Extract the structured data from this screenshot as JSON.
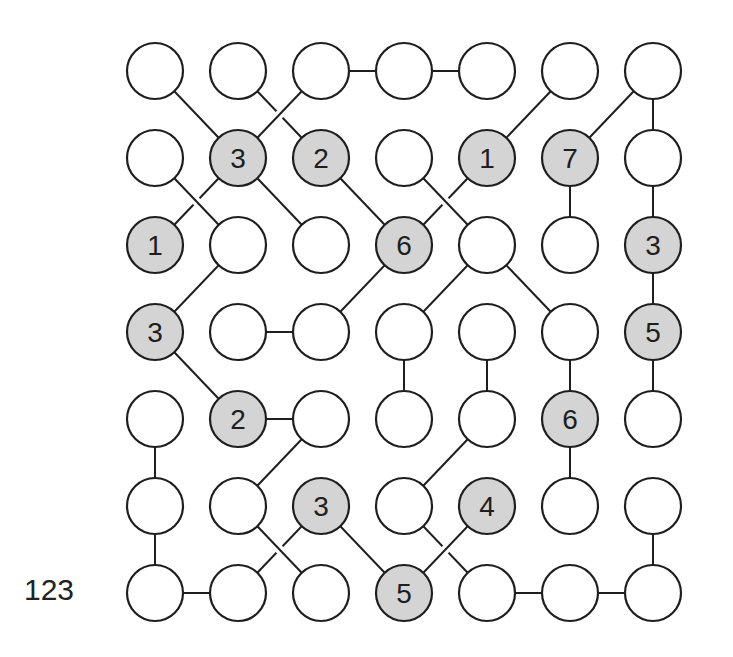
{
  "puzzle": {
    "id_label": "123",
    "rows": 7,
    "cols": 7,
    "colors": {
      "stroke": "#1e1e1e",
      "empty_fill": "#ffffff",
      "clue_fill": "#d4d4d4",
      "text": "#1e1e1e",
      "background": "#ffffff"
    },
    "grid": [
      [
        null,
        null,
        null,
        null,
        null,
        null,
        null
      ],
      [
        null,
        3,
        2,
        null,
        1,
        7,
        null
      ],
      [
        1,
        null,
        null,
        6,
        null,
        null,
        3
      ],
      [
        3,
        null,
        null,
        null,
        null,
        null,
        5
      ],
      [
        null,
        2,
        null,
        null,
        null,
        6,
        null
      ],
      [
        null,
        null,
        3,
        null,
        4,
        null,
        null
      ],
      [
        null,
        null,
        null,
        5,
        null,
        null,
        null
      ]
    ],
    "edges": [
      {
        "from": [
          0,
          2
        ],
        "to": [
          0,
          3
        ],
        "gap": false
      },
      {
        "from": [
          0,
          3
        ],
        "to": [
          0,
          4
        ],
        "gap": false
      },
      {
        "from": [
          0,
          0
        ],
        "to": [
          1,
          1
        ],
        "gap": false
      },
      {
        "from": [
          0,
          2
        ],
        "to": [
          1,
          1
        ],
        "gap": false
      },
      {
        "from": [
          0,
          1
        ],
        "to": [
          1,
          2
        ],
        "gap": true
      },
      {
        "from": [
          0,
          5
        ],
        "to": [
          1,
          4
        ],
        "gap": false
      },
      {
        "from": [
          0,
          6
        ],
        "to": [
          1,
          5
        ],
        "gap": false
      },
      {
        "from": [
          0,
          6
        ],
        "to": [
          1,
          6
        ],
        "gap": false
      },
      {
        "from": [
          1,
          0
        ],
        "to": [
          2,
          1
        ],
        "gap": false
      },
      {
        "from": [
          1,
          1
        ],
        "to": [
          2,
          0
        ],
        "gap": true
      },
      {
        "from": [
          1,
          1
        ],
        "to": [
          2,
          2
        ],
        "gap": false
      },
      {
        "from": [
          1,
          3
        ],
        "to": [
          2,
          4
        ],
        "gap": false
      },
      {
        "from": [
          1,
          2
        ],
        "to": [
          2,
          3
        ],
        "gap": false
      },
      {
        "from": [
          1,
          4
        ],
        "to": [
          2,
          3
        ],
        "gap": true
      },
      {
        "from": [
          1,
          5
        ],
        "to": [
          2,
          5
        ],
        "gap": false
      },
      {
        "from": [
          1,
          6
        ],
        "to": [
          2,
          6
        ],
        "gap": false
      },
      {
        "from": [
          2,
          1
        ],
        "to": [
          3,
          0
        ],
        "gap": false
      },
      {
        "from": [
          2,
          3
        ],
        "to": [
          3,
          2
        ],
        "gap": false
      },
      {
        "from": [
          2,
          4
        ],
        "to": [
          3,
          3
        ],
        "gap": false
      },
      {
        "from": [
          2,
          4
        ],
        "to": [
          3,
          5
        ],
        "gap": false
      },
      {
        "from": [
          2,
          6
        ],
        "to": [
          3,
          6
        ],
        "gap": false
      },
      {
        "from": [
          3,
          1
        ],
        "to": [
          3,
          2
        ],
        "gap": false
      },
      {
        "from": [
          3,
          0
        ],
        "to": [
          4,
          1
        ],
        "gap": false
      },
      {
        "from": [
          3,
          3
        ],
        "to": [
          4,
          3
        ],
        "gap": false
      },
      {
        "from": [
          3,
          4
        ],
        "to": [
          4,
          4
        ],
        "gap": false
      },
      {
        "from": [
          3,
          5
        ],
        "to": [
          4,
          5
        ],
        "gap": false
      },
      {
        "from": [
          3,
          6
        ],
        "to": [
          4,
          6
        ],
        "gap": false
      },
      {
        "from": [
          4,
          1
        ],
        "to": [
          4,
          2
        ],
        "gap": false
      },
      {
        "from": [
          4,
          0
        ],
        "to": [
          5,
          0
        ],
        "gap": false
      },
      {
        "from": [
          4,
          2
        ],
        "to": [
          5,
          1
        ],
        "gap": false
      },
      {
        "from": [
          4,
          4
        ],
        "to": [
          5,
          3
        ],
        "gap": false
      },
      {
        "from": [
          4,
          5
        ],
        "to": [
          5,
          5
        ],
        "gap": false
      },
      {
        "from": [
          5,
          0
        ],
        "to": [
          6,
          0
        ],
        "gap": false
      },
      {
        "from": [
          5,
          1
        ],
        "to": [
          6,
          2
        ],
        "gap": false
      },
      {
        "from": [
          5,
          2
        ],
        "to": [
          6,
          1
        ],
        "gap": true
      },
      {
        "from": [
          5,
          2
        ],
        "to": [
          6,
          3
        ],
        "gap": false
      },
      {
        "from": [
          5,
          4
        ],
        "to": [
          6,
          3
        ],
        "gap": false
      },
      {
        "from": [
          5,
          3
        ],
        "to": [
          6,
          4
        ],
        "gap": true
      },
      {
        "from": [
          5,
          6
        ],
        "to": [
          6,
          6
        ],
        "gap": false
      },
      {
        "from": [
          6,
          0
        ],
        "to": [
          6,
          1
        ],
        "gap": false
      },
      {
        "from": [
          6,
          4
        ],
        "to": [
          6,
          5
        ],
        "gap": false
      },
      {
        "from": [
          6,
          5
        ],
        "to": [
          6,
          6
        ],
        "gap": false
      }
    ]
  }
}
